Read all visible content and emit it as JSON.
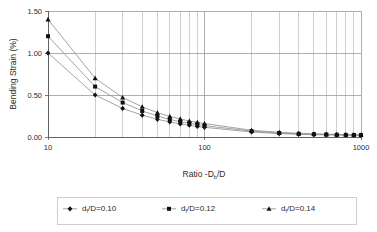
{
  "chart_data": {
    "type": "line",
    "title": "",
    "xlabel": "Ratio -Db/D",
    "xlabel_parts": {
      "pre": "Ratio -D",
      "sub": "b",
      "post": "/D"
    },
    "ylabel": "Bending Strain (%)",
    "xscale": "log",
    "xlim": [
      10,
      1000
    ],
    "ylim": [
      0.0,
      1.5
    ],
    "grid": true,
    "legend_position": "bottom",
    "x_tick_labels": [
      "10",
      "100",
      "1000"
    ],
    "x_tick_values": [
      10,
      100,
      1000
    ],
    "y_tick_labels": [
      "0.00",
      "0.50",
      "1.00",
      "1.50"
    ],
    "y_tick_values": [
      0.0,
      0.5,
      1.0,
      1.5
    ],
    "x": [
      10,
      20,
      30,
      40,
      50,
      60,
      70,
      80,
      90,
      100,
      200,
      300,
      400,
      500,
      600,
      700,
      800,
      900,
      1000
    ],
    "series": [
      {
        "name": "df/D=0.10",
        "name_parts": {
          "pre": "d",
          "sub": "f",
          "post": "/D=0.10"
        },
        "marker": "diamond",
        "values": [
          1.0,
          0.5,
          0.34,
          0.26,
          0.21,
          0.18,
          0.155,
          0.14,
          0.125,
          0.115,
          0.06,
          0.04,
          0.032,
          0.028,
          0.025,
          0.023,
          0.021,
          0.02,
          0.019
        ]
      },
      {
        "name": "df/D=0.12",
        "name_parts": {
          "pre": "d",
          "sub": "f",
          "post": "/D=0.12"
        },
        "marker": "square",
        "values": [
          1.2,
          0.6,
          0.41,
          0.31,
          0.25,
          0.21,
          0.18,
          0.165,
          0.15,
          0.135,
          0.07,
          0.048,
          0.038,
          0.033,
          0.03,
          0.027,
          0.025,
          0.024,
          0.023
        ]
      },
      {
        "name": "df/D=0.14",
        "name_parts": {
          "pre": "d",
          "sub": "f",
          "post": "/D=0.14"
        },
        "marker": "triangle",
        "values": [
          1.4,
          0.7,
          0.47,
          0.36,
          0.29,
          0.245,
          0.215,
          0.19,
          0.175,
          0.16,
          0.08,
          0.056,
          0.044,
          0.038,
          0.034,
          0.031,
          0.029,
          0.027,
          0.026
        ]
      }
    ],
    "colors": {
      "marker": "#111111",
      "line": "#8d8d8d",
      "grid": "#b9b9b9",
      "axis": "#5a5a5a",
      "text": "#2b2b2b",
      "background": "#ffffff"
    }
  }
}
